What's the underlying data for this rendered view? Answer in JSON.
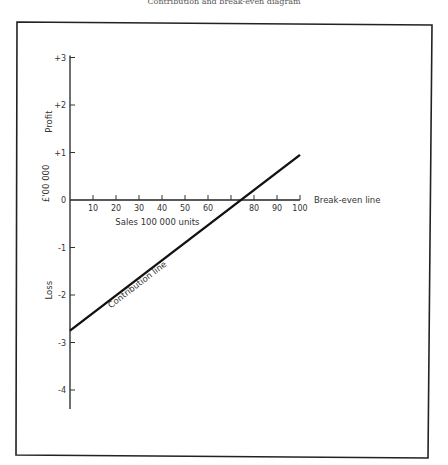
{
  "page": {
    "header_text": "Contribution and break-even diagram"
  },
  "chart_data": {
    "type": "line",
    "title": "",
    "xlabel": "Sales 100 000 units",
    "ylabel": "£'00 000",
    "y_region_labels": {
      "positive": "Profit",
      "negative": "Loss"
    },
    "xlim": [
      0,
      100
    ],
    "ylim": [
      -4.4,
      3
    ],
    "x_ticks": [
      10,
      20,
      30,
      40,
      50,
      60,
      70,
      80,
      90,
      100
    ],
    "x_tick_labels": [
      "10",
      "20",
      "30",
      "40",
      "50",
      "60",
      "",
      "80",
      "90",
      "100"
    ],
    "y_ticks": [
      3,
      2,
      1,
      0,
      -1,
      -2,
      -3,
      -4
    ],
    "y_tick_labels": [
      "+3",
      "+2",
      "+1",
      "0",
      "-1",
      "-2",
      "-3",
      "-4"
    ],
    "grid": false,
    "series": [
      {
        "name": "Contribution line",
        "x": [
          0,
          100
        ],
        "y": [
          -2.75,
          0.95
        ]
      }
    ],
    "annotations": [
      {
        "text": "Break-even line",
        "target": "x-axis (profit = 0)"
      },
      {
        "text": "Contribution line",
        "target": "series 0"
      }
    ],
    "break_even_sales": 74.3
  }
}
